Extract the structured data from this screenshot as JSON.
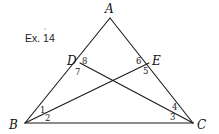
{
  "caption": "Ex. 14",
  "points": {
    "A": {
      "label": "A",
      "x": 110,
      "y": 18
    },
    "B": {
      "label": "B",
      "x": 25,
      "y": 123
    },
    "C": {
      "label": "C",
      "x": 193,
      "y": 123
    },
    "D": {
      "label": "D",
      "x": 80,
      "y": 63
    },
    "E": {
      "label": "E",
      "x": 149,
      "y": 63
    }
  },
  "segments": [
    {
      "from": "A",
      "to": "B"
    },
    {
      "from": "A",
      "to": "C"
    },
    {
      "from": "B",
      "to": "C"
    },
    {
      "from": "B",
      "to": "E"
    },
    {
      "from": "C",
      "to": "D"
    }
  ],
  "angles": {
    "a1": "1",
    "a2": "2",
    "a3": "3",
    "a4": "4",
    "a5": "5",
    "a6": "6",
    "a7": "7",
    "a8": "8"
  },
  "colors": {
    "stroke": "#1a1a1a",
    "background": "#ffffff"
  }
}
